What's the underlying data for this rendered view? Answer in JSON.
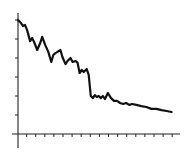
{
  "chart_data": {
    "type": "line",
    "title": "",
    "xlabel": "",
    "ylabel": "",
    "grid": false,
    "legend": null,
    "tick_labels": false,
    "x_ticks": 17,
    "y_ticks": 6,
    "xlim": [
      0,
      17
    ],
    "ylim": [
      -0.75,
      6.2
    ],
    "series": [
      {
        "name": "series-1",
        "color": "#111111",
        "x": [
          0.0,
          0.33,
          0.55,
          0.77,
          1.0,
          1.33,
          1.55,
          1.77,
          2.11,
          2.44,
          2.66,
          3.0,
          3.33,
          3.66,
          3.88,
          4.11,
          4.33,
          4.66,
          4.88,
          5.22,
          5.44,
          5.77,
          6.0,
          6.33,
          6.55,
          6.77,
          7.0,
          7.22,
          7.55,
          7.77,
          8.0,
          8.22,
          8.44,
          8.66,
          8.88,
          9.11,
          9.33,
          9.55,
          9.88,
          10.22,
          10.55,
          10.88,
          11.22,
          11.55,
          11.88,
          12.22,
          12.55,
          13.0,
          13.55,
          14.11,
          14.66,
          15.22,
          15.77,
          16.33,
          16.88
        ],
        "values": [
          6.0,
          5.84,
          5.68,
          5.74,
          5.47,
          4.89,
          5.05,
          4.84,
          4.42,
          4.79,
          5.11,
          4.68,
          4.32,
          3.79,
          4.16,
          4.26,
          4.32,
          4.42,
          4.05,
          3.68,
          3.84,
          4.0,
          3.79,
          3.84,
          3.74,
          3.21,
          3.37,
          3.26,
          3.42,
          3.11,
          2.0,
          1.89,
          2.05,
          1.95,
          2.0,
          1.89,
          2.0,
          1.84,
          2.16,
          1.89,
          1.74,
          1.74,
          1.63,
          1.58,
          1.63,
          1.53,
          1.58,
          1.53,
          1.47,
          1.42,
          1.32,
          1.32,
          1.26,
          1.21,
          1.16
        ]
      }
    ]
  }
}
